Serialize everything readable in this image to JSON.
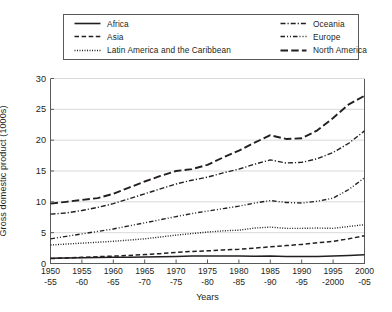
{
  "chart_data": {
    "type": "line",
    "title": "",
    "xlabel": "Years",
    "ylabel": "Gross domestic product (1000s)",
    "ylim": [
      0,
      30
    ],
    "yticks": [
      0,
      5,
      10,
      15,
      20,
      25,
      30
    ],
    "grid": true,
    "legend_position": "top",
    "categories": [
      "1950-55",
      "1955-60",
      "1960-65",
      "1965-70",
      "1970-75",
      "1975-80",
      "1980-85",
      "1985-90",
      "1990-95",
      "1995-2000",
      "2000-05"
    ],
    "x_tick_lines": [
      [
        "1950",
        "-55"
      ],
      [
        "1955",
        "-60"
      ],
      [
        "1960",
        "-65"
      ],
      [
        "1965",
        "-70"
      ],
      [
        "1970",
        "-75"
      ],
      [
        "1975",
        "-80"
      ],
      [
        "1980",
        "-85"
      ],
      [
        "1985",
        "-90"
      ],
      [
        "1990",
        "-95"
      ],
      [
        "1995",
        "-2000"
      ],
      [
        "2000",
        "-05"
      ]
    ],
    "series": [
      {
        "name": "Africa",
        "style": "solid",
        "values": [
          0.85,
          0.95,
          1.0,
          1.05,
          1.15,
          1.2,
          1.2,
          1.2,
          1.15,
          1.2,
          1.4
        ]
      },
      {
        "name": "Asia",
        "style": "dashed",
        "values": [
          0.8,
          1.0,
          1.2,
          1.45,
          1.8,
          2.05,
          2.3,
          2.7,
          3.1,
          3.6,
          4.5
        ]
      },
      {
        "name": "Latin America and the Caribbean",
        "style": "dotted",
        "values": [
          3.0,
          3.3,
          3.6,
          4.0,
          4.6,
          5.1,
          5.4,
          5.9,
          5.7,
          5.9,
          6.3
        ]
      },
      {
        "name": "Oceania",
        "style": "dash-dot",
        "values": [
          8.0,
          8.6,
          9.7,
          11.3,
          12.9,
          14.0,
          15.3,
          16.8,
          16.4,
          18.0,
          21.5
        ]
      },
      {
        "name": "Europe",
        "style": "dash-dot-dot",
        "values": [
          4.0,
          4.8,
          5.6,
          6.6,
          7.6,
          8.5,
          9.3,
          10.2,
          9.8,
          10.6,
          13.9
        ]
      },
      {
        "name": "North America",
        "style": "long-dash",
        "values": [
          9.7,
          10.3,
          11.3,
          13.3,
          15.0,
          16.0,
          18.3,
          20.8,
          20.3,
          23.6,
          27.2
        ]
      }
    ],
    "series_detail": [
      {
        "name": "Africa",
        "points": [
          [
            0,
            0.85
          ],
          [
            0.5,
            0.9
          ],
          [
            1,
            0.95
          ],
          [
            1.5,
            0.98
          ],
          [
            2,
            1.0
          ],
          [
            2.5,
            1.03
          ],
          [
            3,
            1.05
          ],
          [
            3.5,
            1.1
          ],
          [
            4,
            1.15
          ],
          [
            4.5,
            1.2
          ],
          [
            5,
            1.2
          ],
          [
            5.5,
            1.2
          ],
          [
            6,
            1.2
          ],
          [
            6.5,
            1.18
          ],
          [
            7,
            1.2
          ],
          [
            7.5,
            1.15
          ],
          [
            8,
            1.15
          ],
          [
            8.5,
            1.15
          ],
          [
            9,
            1.2
          ],
          [
            9.5,
            1.3
          ],
          [
            10,
            1.4
          ]
        ]
      },
      {
        "name": "Asia",
        "points": [
          [
            0,
            0.8
          ],
          [
            0.5,
            0.9
          ],
          [
            1,
            1.0
          ],
          [
            1.5,
            1.1
          ],
          [
            2,
            1.2
          ],
          [
            2.5,
            1.3
          ],
          [
            3,
            1.45
          ],
          [
            3.5,
            1.6
          ],
          [
            4,
            1.8
          ],
          [
            4.5,
            1.95
          ],
          [
            5,
            2.05
          ],
          [
            5.5,
            2.2
          ],
          [
            6,
            2.3
          ],
          [
            6.5,
            2.5
          ],
          [
            7,
            2.7
          ],
          [
            7.5,
            2.9
          ],
          [
            8,
            3.1
          ],
          [
            8.5,
            3.35
          ],
          [
            9,
            3.6
          ],
          [
            9.5,
            4.0
          ],
          [
            10,
            4.5
          ]
        ]
      },
      {
        "name": "Latin America and the Caribbean",
        "points": [
          [
            0,
            3.0
          ],
          [
            0.5,
            3.15
          ],
          [
            1,
            3.3
          ],
          [
            1.5,
            3.45
          ],
          [
            2,
            3.6
          ],
          [
            2.5,
            3.8
          ],
          [
            3,
            4.0
          ],
          [
            3.5,
            4.3
          ],
          [
            4,
            4.6
          ],
          [
            4.5,
            4.85
          ],
          [
            5,
            5.1
          ],
          [
            5.5,
            5.3
          ],
          [
            6,
            5.4
          ],
          [
            6.5,
            5.75
          ],
          [
            7,
            5.9
          ],
          [
            7.5,
            5.7
          ],
          [
            8,
            5.7
          ],
          [
            8.5,
            5.75
          ],
          [
            9,
            5.7
          ],
          [
            9.5,
            6.0
          ],
          [
            10,
            6.3
          ]
        ]
      },
      {
        "name": "Oceania",
        "points": [
          [
            0,
            8.0
          ],
          [
            0.5,
            8.2
          ],
          [
            1,
            8.6
          ],
          [
            1.5,
            9.1
          ],
          [
            2,
            9.7
          ],
          [
            2.5,
            10.5
          ],
          [
            3,
            11.3
          ],
          [
            3.5,
            12.1
          ],
          [
            4,
            12.9
          ],
          [
            4.5,
            13.5
          ],
          [
            5,
            14.0
          ],
          [
            5.5,
            14.7
          ],
          [
            6,
            15.3
          ],
          [
            6.5,
            16.1
          ],
          [
            7,
            16.8
          ],
          [
            7.5,
            16.3
          ],
          [
            8,
            16.4
          ],
          [
            8.5,
            17.0
          ],
          [
            9,
            18.0
          ],
          [
            9.5,
            19.5
          ],
          [
            10,
            21.5
          ]
        ]
      },
      {
        "name": "Europe",
        "points": [
          [
            0,
            4.0
          ],
          [
            0.5,
            4.4
          ],
          [
            1,
            4.8
          ],
          [
            1.5,
            5.2
          ],
          [
            2,
            5.6
          ],
          [
            2.5,
            6.1
          ],
          [
            3,
            6.6
          ],
          [
            3.5,
            7.1
          ],
          [
            4,
            7.6
          ],
          [
            4.5,
            8.1
          ],
          [
            5,
            8.5
          ],
          [
            5.5,
            8.9
          ],
          [
            6,
            9.3
          ],
          [
            6.5,
            9.8
          ],
          [
            7,
            10.2
          ],
          [
            7.5,
            9.9
          ],
          [
            8,
            9.8
          ],
          [
            8.5,
            10.1
          ],
          [
            9,
            10.6
          ],
          [
            9.5,
            12.0
          ],
          [
            10,
            13.9
          ]
        ]
      },
      {
        "name": "North America",
        "points": [
          [
            0,
            9.7
          ],
          [
            0.5,
            10.0
          ],
          [
            1,
            10.3
          ],
          [
            1.5,
            10.6
          ],
          [
            2,
            11.3
          ],
          [
            2.5,
            12.3
          ],
          [
            3,
            13.3
          ],
          [
            3.5,
            14.2
          ],
          [
            4,
            15.0
          ],
          [
            4.5,
            15.3
          ],
          [
            5,
            16.0
          ],
          [
            5.5,
            17.2
          ],
          [
            6,
            18.3
          ],
          [
            6.5,
            19.6
          ],
          [
            7,
            20.8
          ],
          [
            7.5,
            20.2
          ],
          [
            8,
            20.3
          ],
          [
            8.5,
            21.6
          ],
          [
            9,
            23.6
          ],
          [
            9.5,
            25.8
          ],
          [
            10,
            27.2
          ]
        ]
      }
    ],
    "legend": {
      "entries": [
        {
          "label": "Africa",
          "style": "solid"
        },
        {
          "label": "Oceania",
          "style": "dash-dot"
        },
        {
          "label": "Asia",
          "style": "dashed"
        },
        {
          "label": "Europe",
          "style": "dash-dot-dot"
        },
        {
          "label": "Latin America and the Caribbean",
          "style": "dotted"
        },
        {
          "label": "North America",
          "style": "long-dash"
        }
      ]
    },
    "colors": {
      "line": "#231f20",
      "grid": "#d9d9d9",
      "axis": "#58595b",
      "background": "#ffffff"
    }
  }
}
